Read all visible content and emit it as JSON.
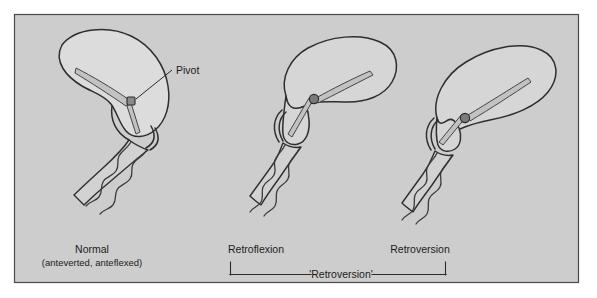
{
  "figure": {
    "panel": {
      "background_color": "#cdcdcd",
      "border_color": "#4a4a4a",
      "page_background": "#ffffff"
    },
    "callout": {
      "label": "Pivot"
    },
    "specimens": [
      {
        "id": "normal",
        "caption_line1": "Normal",
        "caption_line2": "(anteverted, anteflexed)",
        "pivot_marker": "square"
      },
      {
        "id": "retroflexion",
        "caption_line1": "Retroflexion",
        "caption_line2": "",
        "pivot_marker": "dot"
      },
      {
        "id": "retroversion",
        "caption_line1": "Retroversion",
        "caption_line2": "",
        "pivot_marker": "dot"
      }
    ],
    "group_bracket": {
      "label": "'Retroversion'"
    },
    "colors": {
      "organ_fill": "#dcdcdc",
      "outline": "#2e2e2e",
      "pivot_fill": "#7a7a7a",
      "text": "#1c1c1c"
    }
  }
}
